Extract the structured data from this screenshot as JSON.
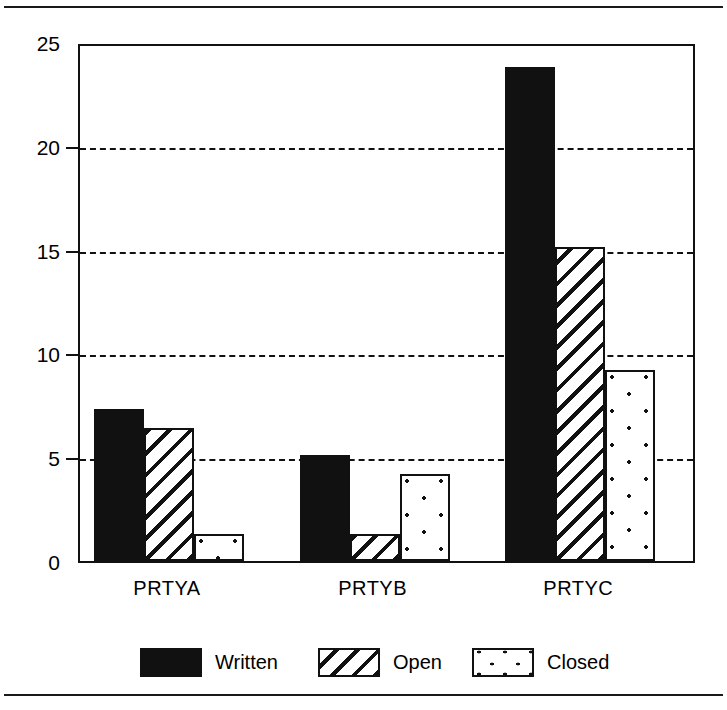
{
  "chart_data": {
    "type": "bar",
    "title": "",
    "subtitle": "",
    "xlabel": "",
    "ylabel": "",
    "categories": [
      "PRTYA",
      "PRTYB",
      "PRTYC"
    ],
    "series": [
      {
        "name": "Written",
        "pattern": "solid-black",
        "values": [
          7.4,
          5.2,
          23.9
        ]
      },
      {
        "name": "Open",
        "pattern": "diagonal-hatch",
        "values": [
          6.5,
          1.4,
          15.2
        ]
      },
      {
        "name": "Closed",
        "pattern": "dotted",
        "values": [
          1.4,
          4.3,
          9.3
        ]
      }
    ],
    "ylim": [
      0,
      25
    ],
    "yticks": [
      0,
      5,
      10,
      15,
      20,
      25
    ],
    "ytick_labels": [
      "0",
      "5",
      "10",
      "15",
      "20",
      "25"
    ],
    "grid": true,
    "grid_style": "dashed-horizontal",
    "grid_values": [
      5,
      10,
      15,
      20
    ],
    "legend_position": "bottom",
    "colors": {
      "ink": "#111111",
      "background": "#ffffff",
      "written": "#111111",
      "open": "#ffffff",
      "closed": "#ffffff"
    }
  },
  "figure": {
    "top_rule": "",
    "bottom_rule": ""
  },
  "legend": {
    "items": [
      {
        "label": "Written"
      },
      {
        "label": "Open"
      },
      {
        "label": "Closed"
      }
    ]
  }
}
